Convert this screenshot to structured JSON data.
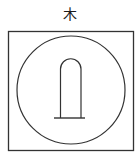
{
  "symbol": {
    "label": "木",
    "description": "Square frame enclosing a circle with an arched pillar on a base line",
    "stroke_color": "#333333"
  }
}
